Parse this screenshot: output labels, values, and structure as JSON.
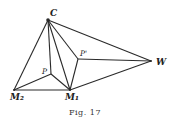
{
  "figure": {
    "caption": "Fig. 17",
    "points": {
      "C": "C",
      "W": "W",
      "P_prime": "P'",
      "P": "P",
      "M1": "M₁",
      "M2": "M₂"
    },
    "edges": [
      [
        "C",
        "M2"
      ],
      [
        "C",
        "P"
      ],
      [
        "C",
        "M1"
      ],
      [
        "C",
        "P_prime"
      ],
      [
        "C",
        "W"
      ],
      [
        "P_prime",
        "W"
      ],
      [
        "P_prime",
        "M1"
      ],
      [
        "P",
        "M2"
      ],
      [
        "P",
        "M1"
      ],
      [
        "M2",
        "M1"
      ],
      [
        "M1",
        "W"
      ]
    ]
  }
}
